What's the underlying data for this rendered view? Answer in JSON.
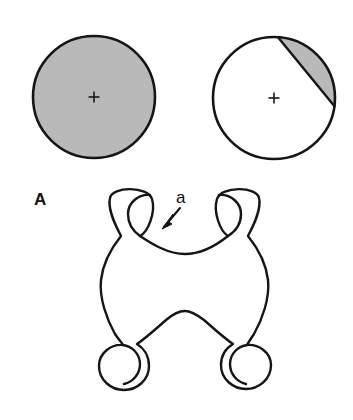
{
  "figure": {
    "panel_label": "A",
    "feature_label": "a",
    "colors": {
      "fill_gray": "#b9b9b9",
      "fill_white": "#ffffff",
      "stroke_black": "#151515",
      "background": "#ffffff"
    },
    "top_row": {
      "left_circle": {
        "name": "fully-shaded-circle",
        "cx": 94,
        "cy": 97,
        "r": 61,
        "fill": "#b9b9b9",
        "stroke_width": 2.6,
        "center_mark": "plus",
        "shaded_fraction": 1.0
      },
      "right_circle": {
        "name": "partially-shaded-circle",
        "cx": 274,
        "cy": 98,
        "r": 61,
        "fill": "#ffffff",
        "stroke_width": 2.6,
        "center_mark": "plus",
        "shaded_fraction": 0.12,
        "segment": {
          "chord_start": [
            278,
            27
          ],
          "chord_end": [
            334,
            104
          ],
          "shaded_side": "upper-right"
        }
      }
    },
    "bottom_shape": {
      "name": "four-legged-saddle-shape",
      "fill": "#ffffff",
      "stroke_width": 2.4,
      "leg_circles": [
        {
          "position": "top-left",
          "cx": 130,
          "cy": 214,
          "r": 25
        },
        {
          "position": "top-right",
          "cx": 238,
          "cy": 214,
          "r": 25
        },
        {
          "position": "bottom-left",
          "cx": 124,
          "cy": 365,
          "r": 25
        },
        {
          "position": "bottom-right",
          "cx": 246,
          "cy": 363,
          "r": 25
        }
      ],
      "notches": {
        "top_saddle_bottom": [
          185,
          251
        ],
        "bottom_saddle_top": [
          185,
          312
        ],
        "left_waist_x": 104,
        "right_waist_x": 267
      }
    },
    "annotation": {
      "label": "a",
      "label_position": [
        178,
        201
      ],
      "arrow_from": [
        180,
        208
      ],
      "arrow_to": [
        163,
        228
      ],
      "points_to": "top-saddle-neck"
    }
  }
}
